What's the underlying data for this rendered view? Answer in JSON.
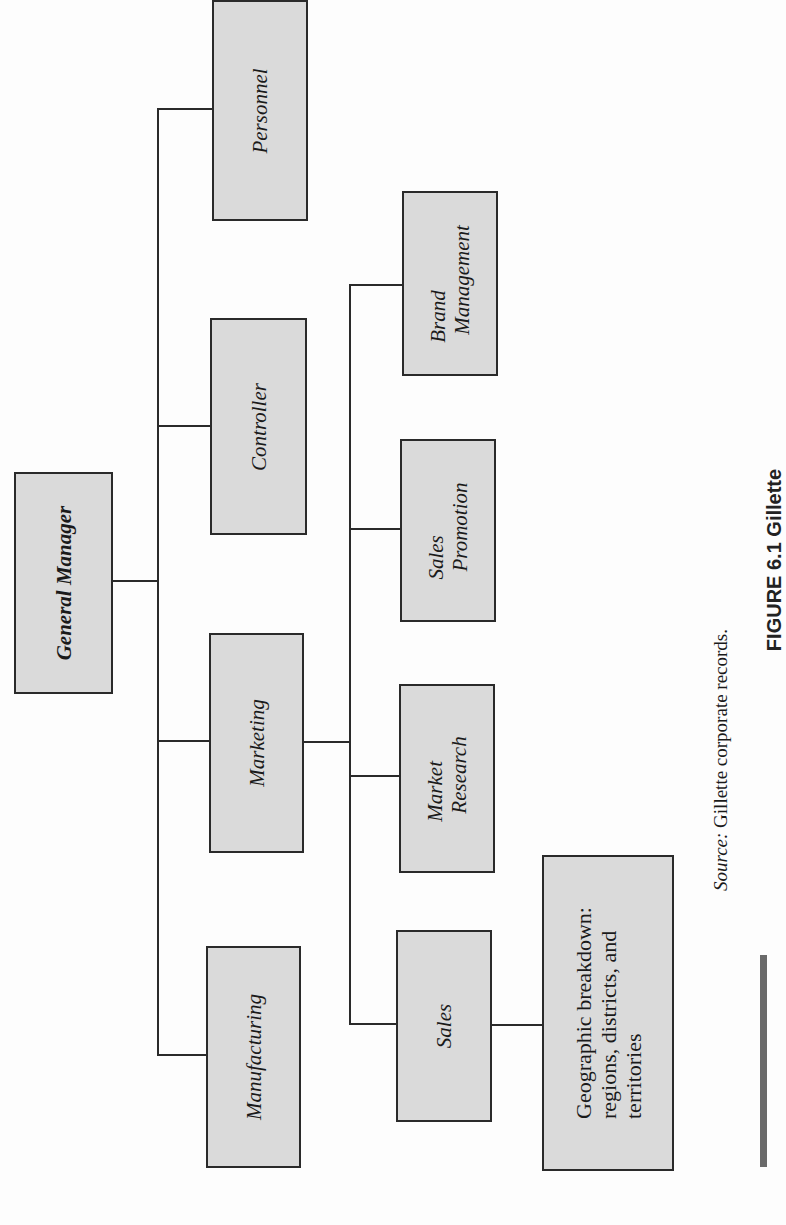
{
  "figure": {
    "orientation": "rotated 90 degrees counter-clockwise",
    "source_prefix": "Source:",
    "source_text": " Gillette corporate records.",
    "caption_visible": "FIGURE 6.1 Gillette"
  },
  "org_chart": {
    "root": "General Manager",
    "departments": [
      "Personnel",
      "Controller",
      "Marketing",
      "Manufacturing"
    ],
    "marketing_units": [
      "Brand Management",
      "Sales Promotion",
      "Market Research",
      "Sales"
    ],
    "sales_subunit": "Geographic breakdown: regions, districts, and territories"
  },
  "boxes": {
    "general_manager": "General Manager",
    "personnel": "Personnel",
    "controller": "Controller",
    "marketing": "Marketing",
    "manufacturing": "Manufacturing",
    "brand_management": {
      "line1": "Brand",
      "line2": "Management"
    },
    "sales_promotion": {
      "line1": "Sales",
      "line2": "Promotion"
    },
    "market_research": {
      "line1": "Market",
      "line2": "Research"
    },
    "sales": "Sales",
    "geographic": {
      "line1": "Geographic breakdown:",
      "line2": "regions, districts, and",
      "line3": "territories"
    }
  }
}
